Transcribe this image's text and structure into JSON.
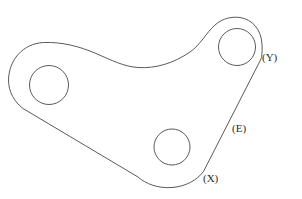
{
  "drawing": {
    "title": "Three-lobed bracket plate outline",
    "background_color": "#ffffff",
    "stroke_color": "#5a5a5a",
    "label_color": "#2a2a2a",
    "stroke_width": 1,
    "canvas": {
      "width": 302,
      "height": 199
    },
    "outline": {
      "name": "part-outline",
      "description": "Closed triangular three-lobed plate profile with filleted lobes, concave top edge, straight lower-left edge, convex bottom edge and straight right edge",
      "path": "M 8.5 80.5 C 8.5 60.0 23.0 43.5 43.5 42.5 C 62.0 41.8 80.0 46.5 96.0 53.5 C 112.0 60.5 124.0 66.5 138.0 67.5 C 156.0 68.7 174.0 63.0 190.0 52.0 C 200.5 44.8 206.0 33.0 215.0 25.0 C 223.0 17.8 232.5 16.5 240.0 17.5 C 252.0 19.2 261.5 29.5 262.0 44.5 C 262.3 51.5 262.0 55.5 261.0 59.0 L 203.5 171.5 C 197.0 180.0 186.0 186.5 172.0 187.5 C 158.0 188.5 146.0 184.0 138.0 177.0 L 23.0 108.5 C 14.5 102.0 8.5 92.0 8.5 80.5 Z"
    },
    "holes": [
      {
        "name": "bolt-hole-left",
        "cx": 49,
        "cy": 85,
        "r": 19.5
      },
      {
        "name": "bolt-hole-top-right",
        "cx": 237,
        "cy": 47,
        "r": 18.5
      },
      {
        "name": "bolt-hole-bottom",
        "cx": 172,
        "cy": 147,
        "r": 18.0
      }
    ],
    "labels": [
      {
        "id": "label-y",
        "name": "callout-label-y",
        "text": "(Y)",
        "x": 262,
        "y": 52
      },
      {
        "id": "label-e",
        "name": "callout-label-e",
        "text": "(E)",
        "x": 232,
        "y": 123
      },
      {
        "id": "label-x",
        "name": "callout-label-x",
        "text": "(X)",
        "x": 203,
        "y": 173
      }
    ]
  }
}
